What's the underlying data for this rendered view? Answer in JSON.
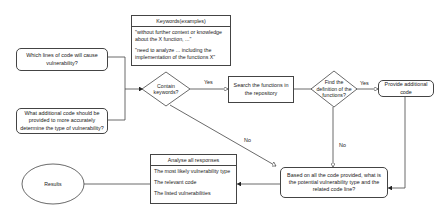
{
  "diagram": {
    "questions": [
      {
        "text": "Which lines of code will cause vulnerability?"
      },
      {
        "text": "What additional code should be provided to more accurately determine the type of vulnerability?"
      }
    ],
    "keywords_box": {
      "title": "Keywords(examples)",
      "items": [
        "\"without further context or knowledge about the X function, ...\"",
        "\"need to analyze ... including the implementation of the functions X\""
      ]
    },
    "decision_keywords": "Contain keywords?",
    "search_functions": "Search the functions in the repository",
    "decision_definition": "Find the definition of the functions?",
    "provide_code": "Provide additional code",
    "final_question": "Based on all the code provided, what is the potential vulnerability type and the related code line?",
    "analyse_box": {
      "title": "Analyse all responses",
      "items": [
        "The most likely vulnerability type",
        "The relevant code",
        "The listed vulnerabilities"
      ]
    },
    "results": "Results",
    "edge_labels": {
      "yes1": "Yes",
      "yes2": "Yes",
      "no1": "No",
      "no2": "No"
    }
  }
}
